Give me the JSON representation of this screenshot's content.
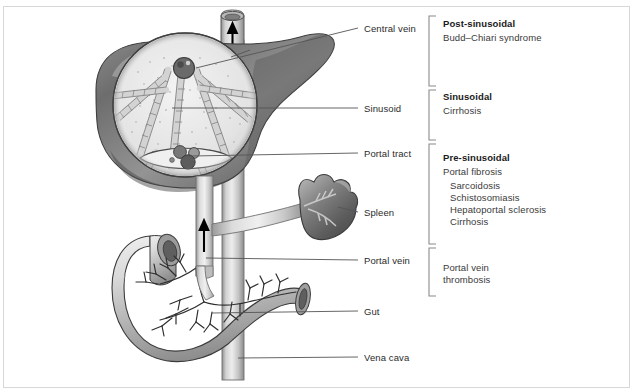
{
  "diagram": {
    "anatomy_labels": [
      {
        "id": "central-vein",
        "text": "Central vein",
        "x": 364,
        "y": 23,
        "leader_from_x": 230,
        "leader_from_y": 58,
        "leader_to_x": 358,
        "leader_to_y": 28
      },
      {
        "id": "sinusoid",
        "text": "Sinusoid",
        "x": 364,
        "y": 103,
        "leader_from_x": 172,
        "leader_from_y": 108,
        "leader_to_x": 358,
        "leader_to_y": 108
      },
      {
        "id": "portal-tract",
        "text": "Portal tract",
        "x": 364,
        "y": 148,
        "leader_from_x": 196,
        "leader_from_y": 155,
        "leader_to_x": 358,
        "leader_to_y": 153
      },
      {
        "id": "spleen",
        "text": "Spleen",
        "x": 364,
        "y": 207,
        "leader_from_x": 338,
        "leader_from_y": 206,
        "leader_to_x": 358,
        "leader_to_y": 212
      },
      {
        "id": "portal-vein",
        "text": "Portal vein",
        "x": 364,
        "y": 255,
        "leader_from_x": 208,
        "leader_from_y": 258,
        "leader_to_x": 358,
        "leader_to_y": 260
      },
      {
        "id": "gut",
        "text": "Gut",
        "x": 364,
        "y": 306,
        "leader_from_x": 212,
        "leader_from_y": 313,
        "leader_to_x": 358,
        "leader_to_y": 311
      },
      {
        "id": "vena-cava",
        "text": "Vena cava",
        "x": 364,
        "y": 352,
        "leader_from_x": 238,
        "leader_from_y": 358,
        "leader_to_x": 358,
        "leader_to_y": 357
      }
    ],
    "categories": [
      {
        "id": "post-sinusoidal",
        "heading": "Post-sinusoidal",
        "items": [
          "Budd–Chiari syndrome"
        ],
        "indented": [],
        "bracket_top": 16,
        "bracket_bottom": 86,
        "heading_y": 22,
        "items_y": 35
      },
      {
        "id": "sinusoidal",
        "heading": "Sinusoidal",
        "items": [
          "Cirrhosis"
        ],
        "indented": [],
        "bracket_top": 90,
        "bracket_bottom": 140,
        "heading_y": 94,
        "items_y": 107
      },
      {
        "id": "pre-sinusoidal",
        "heading": "Pre-sinusoidal",
        "items": [
          "Portal fibrosis"
        ],
        "indented": [
          "Sarcoidosis",
          "Schistosomiasis",
          "Hepatoportal sclerosis",
          "Cirrhosis"
        ],
        "bracket_top": 144,
        "bracket_bottom": 244,
        "heading_y": 155,
        "items_y": 168
      },
      {
        "id": "portal-vein-thrombosis",
        "heading": "",
        "items": [
          "Portal vein",
          "thrombosis"
        ],
        "indented": [],
        "bracket_top": 248,
        "bracket_bottom": 296,
        "heading_y": 0,
        "items_y": 263
      }
    ],
    "flow_arrows": [
      {
        "id": "hepatic-vein-outflow-arrow",
        "direction": "up",
        "x": 232,
        "y": 30
      },
      {
        "id": "portal-vein-inflow-arrow",
        "direction": "up",
        "x": 204,
        "y": 233
      }
    ],
    "structures": [
      {
        "id": "liver",
        "name": "Liver"
      },
      {
        "id": "liver-lobule",
        "name": "Hepatic lobule (magnified inset)"
      },
      {
        "id": "spleen-organ",
        "name": "Spleen"
      },
      {
        "id": "stomach-gut",
        "name": "Gut"
      },
      {
        "id": "vena-cava-vessel",
        "name": "Inferior vena cava"
      },
      {
        "id": "portal-vein-vessel",
        "name": "Portal vein"
      },
      {
        "id": "splenic-vein",
        "name": "Splenic vein"
      }
    ],
    "colors": {
      "ink": "#2b2b2b",
      "heading": "#1a1a1a",
      "leader": "#555555",
      "bracket": "#808080",
      "frame": "#d8d8d8",
      "organ_dark": "#6a6a6a",
      "organ_mid": "#9a9a9a",
      "organ_light": "#d8d8d8",
      "vessel_light": "#cfcfcf",
      "outline": "#3a3a3a"
    }
  }
}
